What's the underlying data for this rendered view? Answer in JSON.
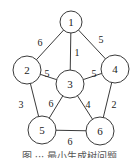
{
  "diagram": {
    "type": "weighted-undirected-graph",
    "nodes": [
      {
        "id": "1",
        "label": "1"
      },
      {
        "id": "2",
        "label": "2"
      },
      {
        "id": "3",
        "label": "3"
      },
      {
        "id": "4",
        "label": "4"
      },
      {
        "id": "5",
        "label": "5"
      },
      {
        "id": "6",
        "label": "6"
      }
    ],
    "edges": [
      {
        "from": "1",
        "to": "2",
        "weight": "6"
      },
      {
        "from": "1",
        "to": "3",
        "weight": "1"
      },
      {
        "from": "1",
        "to": "4",
        "weight": "5"
      },
      {
        "from": "2",
        "to": "3",
        "weight": "5"
      },
      {
        "from": "3",
        "to": "4",
        "weight": "5"
      },
      {
        "from": "2",
        "to": "5",
        "weight": "3"
      },
      {
        "from": "3",
        "to": "5",
        "weight": "6"
      },
      {
        "from": "3",
        "to": "6",
        "weight": "4"
      },
      {
        "from": "4",
        "to": "6",
        "weight": "2"
      },
      {
        "from": "5",
        "to": "6",
        "weight": "6"
      }
    ],
    "caption": "图 ··· 最小生成树问题"
  }
}
